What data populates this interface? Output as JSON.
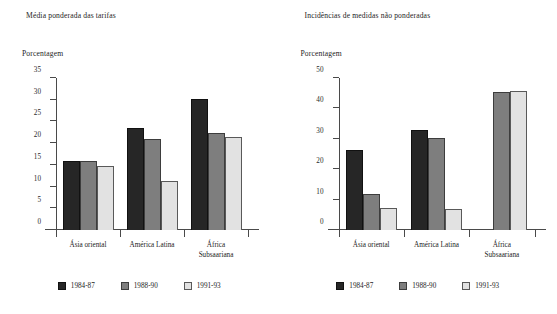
{
  "panels": [
    {
      "title": "Média ponderada das tarifas",
      "axis_unit": "Porcentagem",
      "categories": [
        "Ásia oriental",
        "América Latina",
        "África Subsaariana"
      ],
      "legend": [
        "1984-87",
        "1988-90",
        "1991-93"
      ]
    },
    {
      "title": "Incidências de medidas não ponderadas",
      "axis_unit": "Porcentagem",
      "categories": [
        "Ásia oriental",
        "América Latina",
        "África Subsaariana"
      ],
      "legend": [
        "1984-87",
        "1988-90",
        "1991-93"
      ]
    }
  ],
  "colors": {
    "series_1984_87": "#262626",
    "series_1988_90": "#7e7e7e",
    "series_1991_93": "#e2e2e2",
    "axis": "#4a4a4a",
    "text": "#242424",
    "background": "#ffffff"
  },
  "chart_data": [
    {
      "type": "bar",
      "title": "Média ponderada das tarifas",
      "xlabel": "",
      "ylabel": "Porcentagem",
      "ylim": [
        0,
        35
      ],
      "yticks": [
        0,
        5,
        10,
        15,
        20,
        25,
        30,
        35
      ],
      "grid": false,
      "legend_position": "bottom",
      "categories": [
        "Ásia oriental",
        "América Latina",
        "África Subsaariana"
      ],
      "series": [
        {
          "name": "1984-87",
          "values": [
            16.0,
            23.6,
            30.1
          ]
        },
        {
          "name": "1988-90",
          "values": [
            15.8,
            20.9,
            22.4
          ]
        },
        {
          "name": "1991-93",
          "values": [
            14.7,
            11.4,
            21.5
          ]
        }
      ]
    },
    {
      "type": "bar",
      "title": "Incidências de medidas não ponderadas",
      "xlabel": "",
      "ylabel": "Porcentagem",
      "ylim": [
        0,
        50
      ],
      "yticks": [
        0,
        10,
        20,
        30,
        40,
        50
      ],
      "grid": false,
      "legend_position": "bottom",
      "categories": [
        "Ásia oriental",
        "América Latina",
        "África Subsaariana"
      ],
      "series": [
        {
          "name": "1984-87",
          "values": [
            26.2,
            33.0,
            null
          ]
        },
        {
          "name": "1988-90",
          "values": [
            12.0,
            30.4,
            45.3
          ]
        },
        {
          "name": "1991-93",
          "values": [
            7.2,
            6.9,
            45.7
          ]
        }
      ]
    }
  ]
}
